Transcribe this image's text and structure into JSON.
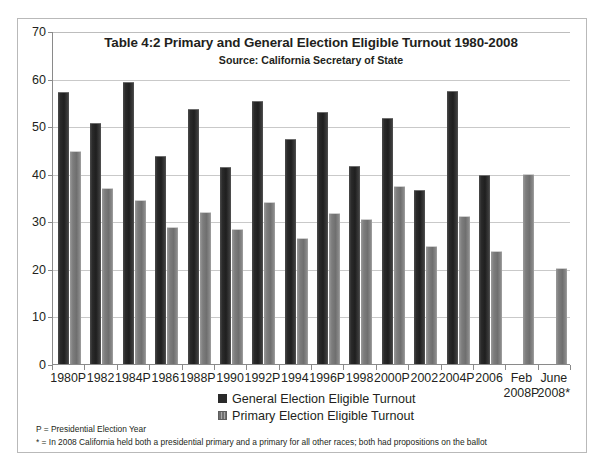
{
  "chart_data": {
    "type": "bar",
    "title": "Table 4:2 Primary and General Election Eligible Turnout 1980-2008",
    "subtitle": "Source: California Secretary of State",
    "xlabel": "",
    "ylabel": "",
    "ylim": [
      0,
      70
    ],
    "yticks": [
      0,
      10,
      20,
      30,
      40,
      50,
      60,
      70
    ],
    "grid": true,
    "legend_position": "bottom-center",
    "categories": [
      "1980P",
      "1982",
      "1984P",
      "1986",
      "1988P",
      "1990",
      "1992P",
      "1994",
      "1996P",
      "1998",
      "2000P",
      "2002",
      "2004P",
      "2006",
      "Feb\n2008P",
      "June\n2008*"
    ],
    "series": [
      {
        "name": "General Election Eligible Turnout",
        "color": "#2a2a2a",
        "values": [
          57.0,
          50.5,
          59.0,
          43.5,
          53.5,
          41.2,
          55.0,
          47.0,
          52.7,
          41.5,
          51.5,
          36.3,
          57.2,
          39.5,
          null,
          null
        ]
      },
      {
        "name": "Primary Election Eligible Turnout",
        "color": "#7d7d7d",
        "values": [
          44.5,
          36.8,
          34.2,
          28.5,
          31.8,
          28.2,
          33.8,
          26.3,
          31.5,
          30.2,
          37.2,
          24.7,
          31.0,
          23.5,
          39.8,
          20.0
        ]
      }
    ]
  },
  "legend": {
    "items": [
      {
        "label": "General Election Eligible Turnout",
        "swatch": "general"
      },
      {
        "label": "Primary Election Eligible Turnout",
        "swatch": "primary"
      }
    ]
  },
  "footnotes": [
    "P = Presidential Election Year",
    "* =  In  2008  California held  both a presidential primary and a primary for all other races; both had propositions on the ballot"
  ]
}
